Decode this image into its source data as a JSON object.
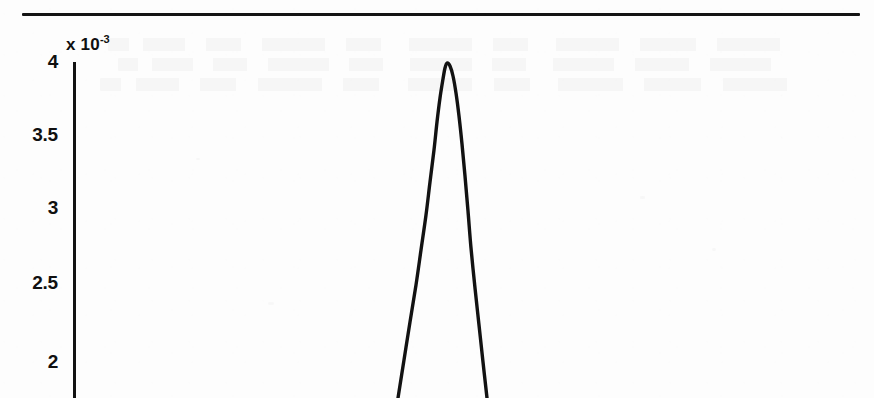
{
  "figure": {
    "background_color": "#fdfdfd",
    "ink_color": "#121212",
    "top_rule": {
      "x1": 22,
      "x2": 860,
      "y": 13,
      "thickness": 3
    }
  },
  "axis": {
    "exponent_label": "x 10",
    "exponent_superscript": "-3",
    "y_axis_x": 73,
    "y_axis_top": 62,
    "y_axis_bottom": 398,
    "tick_length": 9,
    "ticks": [
      {
        "label": "4",
        "value": 4,
        "y": 62
      },
      {
        "label": "3.5",
        "value": 3.5,
        "y": 135
      },
      {
        "label": "3",
        "value": 3,
        "y": 208
      },
      {
        "label": "2.5",
        "value": 2.5,
        "y": 283
      },
      {
        "label": "2",
        "value": 2,
        "y": 362
      }
    ]
  },
  "chart_data": {
    "type": "line",
    "title": "",
    "subtitle": "",
    "xlabel": "",
    "ylabel": "",
    "y_multiplier": "x 10^-3",
    "ylim": [
      1.77,
      4.06
    ],
    "ytick_labels": [
      "2",
      "2.5",
      "3",
      "3.5",
      "4"
    ],
    "ytick_values": [
      2,
      2.5,
      3,
      3.5,
      4
    ],
    "grid": false,
    "legend": null,
    "annotations": [],
    "series": [
      {
        "name": "peak",
        "color": "#121212",
        "line_width": 3,
        "x_pixel": [
          398,
          404,
          410,
          416,
          421,
          426,
          430,
          434,
          437,
          440,
          443,
          445,
          447,
          450,
          453,
          456,
          459,
          462,
          465,
          468,
          471,
          475,
          479,
          483,
          487
        ],
        "y_pixel": [
          398,
          360,
          322,
          285,
          250,
          215,
          182,
          150,
          122,
          98,
          79,
          68,
          63,
          66,
          76,
          93,
          116,
          144,
          176,
          211,
          248,
          288,
          325,
          362,
          398
        ],
        "y_value": [
          1.78,
          2.04,
          2.29,
          2.54,
          2.78,
          3.01,
          3.24,
          3.45,
          3.64,
          3.8,
          3.93,
          4.0,
          4.03,
          4.01,
          3.95,
          3.83,
          3.68,
          3.49,
          3.27,
          3.04,
          2.78,
          2.51,
          2.26,
          2.01,
          1.78
        ]
      }
    ]
  },
  "artifacts": {
    "description": "faint scanner show-through text from reverse page side; illegible",
    "ghost_bands": [
      {
        "x": 108,
        "y": 38,
        "width": 700
      },
      {
        "x": 118,
        "y": 58,
        "width": 680
      },
      {
        "x": 100,
        "y": 78,
        "width": 716
      }
    ]
  }
}
